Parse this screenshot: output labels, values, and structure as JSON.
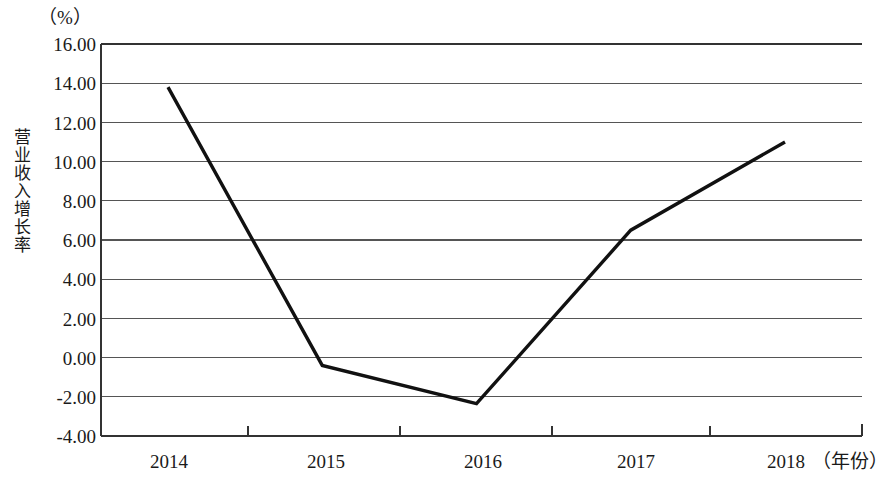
{
  "figure": {
    "unit_label": "（%）",
    "y_axis_title": "营业收入增长率",
    "x_axis_title": "（年份）",
    "line_color": "#111111",
    "axis_color": "#444444",
    "grid_color": "#555555",
    "background": "#ffffff"
  },
  "yticks": [
    {
      "label": "16.00",
      "value": 16
    },
    {
      "label": "14.00",
      "value": 14
    },
    {
      "label": "12.00",
      "value": 12
    },
    {
      "label": "10.00",
      "value": 10
    },
    {
      "label": "8.00",
      "value": 8
    },
    {
      "label": "6.00",
      "value": 6
    },
    {
      "label": "4.00",
      "value": 4
    },
    {
      "label": "2.00",
      "value": 2
    },
    {
      "label": "0.00",
      "value": 0
    },
    {
      "label": "-2.00",
      "value": -2
    },
    {
      "label": "-4.00",
      "value": -4
    }
  ],
  "xticks": [
    {
      "label": "2014"
    },
    {
      "label": "2015"
    },
    {
      "label": "2016"
    },
    {
      "label": "2017"
    },
    {
      "label": "2018"
    }
  ],
  "chart_data": {
    "type": "line",
    "title": "",
    "subtitle": "",
    "xlabel": "（年份）",
    "ylabel": "营业收入增长率",
    "unit": "%",
    "categories": [
      "2014",
      "2015",
      "2016",
      "2017",
      "2018"
    ],
    "x": [
      2014,
      2015,
      2016,
      2017,
      2018
    ],
    "values": [
      13.8,
      -0.4,
      -2.35,
      6.5,
      11.0
    ],
    "series": [
      {
        "name": "营业收入增长率",
        "values": [
          13.8,
          -0.4,
          -2.35,
          6.5,
          11.0
        ]
      }
    ],
    "ylim": [
      -4,
      16
    ],
    "ytick_step": 2,
    "yticks": [
      -4,
      -2,
      0,
      2,
      4,
      6,
      8,
      10,
      12,
      14,
      16
    ],
    "xlim": [
      2014,
      2018
    ],
    "grid": "horizontal",
    "legend": "none",
    "markers": "none",
    "line_color": "#111111",
    "annotations": []
  }
}
